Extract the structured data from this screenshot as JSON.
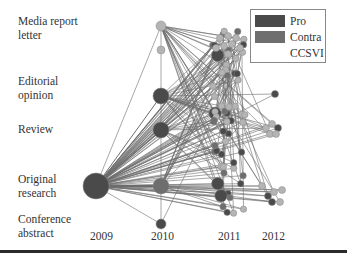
{
  "diagram": {
    "type": "citation-network",
    "y_categories": [
      {
        "id": "media",
        "label_line1": "Media report",
        "label_line2": "letter",
        "y": 26
      },
      {
        "id": "editorial",
        "label_line1": "Editorial",
        "label_line2": "opinion",
        "y": 86
      },
      {
        "id": "review",
        "label_line1": "Review",
        "label_line2": "",
        "y": 130
      },
      {
        "id": "original",
        "label_line1": "Original",
        "label_line2": "research",
        "y": 185
      },
      {
        "id": "conference",
        "label_line1": "Conference",
        "label_line2": "abstract",
        "y": 222
      }
    ],
    "x_years": [
      {
        "label": "2009",
        "x": 96
      },
      {
        "label": "2010",
        "x": 160
      },
      {
        "label": "2011",
        "x": 228
      },
      {
        "label": "2012",
        "x": 270
      }
    ],
    "legend": [
      {
        "label": "Pro",
        "color": "#4a4a4a"
      },
      {
        "label": "Contra",
        "color": "#6e6e6e"
      },
      {
        "label": "CCSVI",
        "color": null
      }
    ],
    "colors": {
      "pro": "#4a4a4a",
      "contra": "#6e6e6e",
      "neutral": "#b4b4b4",
      "edge": "#3c3c3c"
    }
  }
}
